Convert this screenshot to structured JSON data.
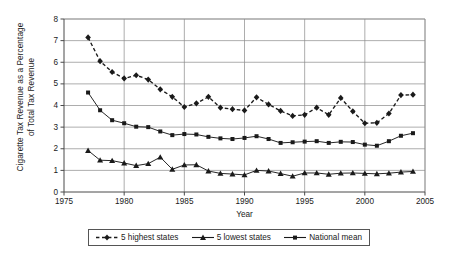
{
  "chart_data": {
    "type": "line",
    "title": "",
    "xlabel": "Year",
    "ylabel": "Cigarette Tax Revenue as a Percentage\nof Total Tax Revenue",
    "xlim": [
      1975,
      2005
    ],
    "ylim": [
      0,
      8
    ],
    "xticks": [
      1975,
      1980,
      1985,
      1990,
      1995,
      2000,
      2005
    ],
    "yticks": [
      0,
      1,
      2,
      3,
      4,
      5,
      6,
      7,
      8
    ],
    "grid": "horizontal-and-vertical",
    "legend_position": "below-axes",
    "x": [
      1977,
      1978,
      1979,
      1980,
      1981,
      1982,
      1983,
      1984,
      1985,
      1986,
      1987,
      1988,
      1989,
      1990,
      1991,
      1992,
      1993,
      1994,
      1995,
      1996,
      1997,
      1998,
      1999,
      2000,
      2001,
      2002,
      2003,
      2004
    ],
    "series": [
      {
        "name": "5 highest states",
        "marker": "diamond",
        "linestyle": "dashed",
        "values": [
          7.15,
          6.05,
          5.55,
          5.25,
          5.4,
          5.2,
          4.75,
          4.4,
          3.93,
          4.1,
          4.4,
          3.9,
          3.83,
          3.77,
          4.38,
          4.05,
          3.75,
          3.52,
          3.57,
          3.9,
          3.57,
          4.35,
          3.73,
          3.18,
          3.2,
          3.63,
          4.48,
          4.5
        ]
      },
      {
        "name": "5 lowest states",
        "marker": "triangle",
        "linestyle": "solid",
        "values": [
          1.92,
          1.47,
          1.45,
          1.34,
          1.22,
          1.31,
          1.61,
          1.05,
          1.25,
          1.26,
          0.97,
          0.86,
          0.83,
          0.79,
          1.0,
          0.97,
          0.85,
          0.73,
          0.88,
          0.88,
          0.82,
          0.87,
          0.88,
          0.86,
          0.84,
          0.87,
          0.92,
          0.95
        ]
      },
      {
        "name": "National mean",
        "marker": "square",
        "linestyle": "solid",
        "values": [
          4.6,
          3.78,
          3.32,
          3.18,
          3.02,
          3.0,
          2.8,
          2.63,
          2.68,
          2.66,
          2.55,
          2.48,
          2.45,
          2.5,
          2.58,
          2.45,
          2.27,
          2.3,
          2.33,
          2.35,
          2.27,
          2.32,
          2.31,
          2.19,
          2.14,
          2.35,
          2.6,
          2.72
        ]
      }
    ]
  },
  "axes": {
    "y_title_line1": "Cigarette Tax Revenue as a Percentage",
    "y_title_line2": "of Total Tax Revenue",
    "x_title": "Year",
    "y_tick_labels": [
      "8",
      "7",
      "6",
      "5",
      "4",
      "3",
      "2",
      "1",
      "0"
    ],
    "x_tick_labels": [
      "1975",
      "1980",
      "1985",
      "1990",
      "1995",
      "2000",
      "2005"
    ]
  },
  "legend": {
    "items": [
      {
        "label": "5 highest states",
        "marker": "diamond",
        "linestyle": "dashed"
      },
      {
        "label": "5 lowest states",
        "marker": "triangle",
        "linestyle": "solid"
      },
      {
        "label": "National mean",
        "marker": "square",
        "linestyle": "solid"
      }
    ]
  },
  "colors": {
    "series": "#1a1a1a",
    "grid": "#8a8a8a",
    "axis": "#4a4a4a",
    "background": "#ffffff"
  }
}
